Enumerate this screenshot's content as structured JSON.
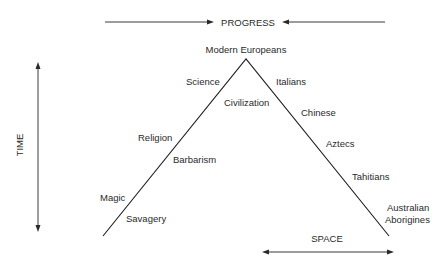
{
  "diagram": {
    "top_axis": {
      "label": "PROGRESS"
    },
    "left_axis": {
      "label": "TIME"
    },
    "bottom_axis": {
      "label": "SPACE"
    },
    "apex_label": "Modern Europeans",
    "left_side_labels": [
      "Science",
      "Religion",
      "Magic"
    ],
    "inner_labels": [
      "Civilization",
      "Barbarism",
      "Savagery"
    ],
    "right_side_labels": [
      "Italians",
      "Chinese",
      "Aztecs",
      "Tahitians"
    ],
    "right_base_label": {
      "line1": "Australian",
      "line2": "Aborigines"
    }
  }
}
